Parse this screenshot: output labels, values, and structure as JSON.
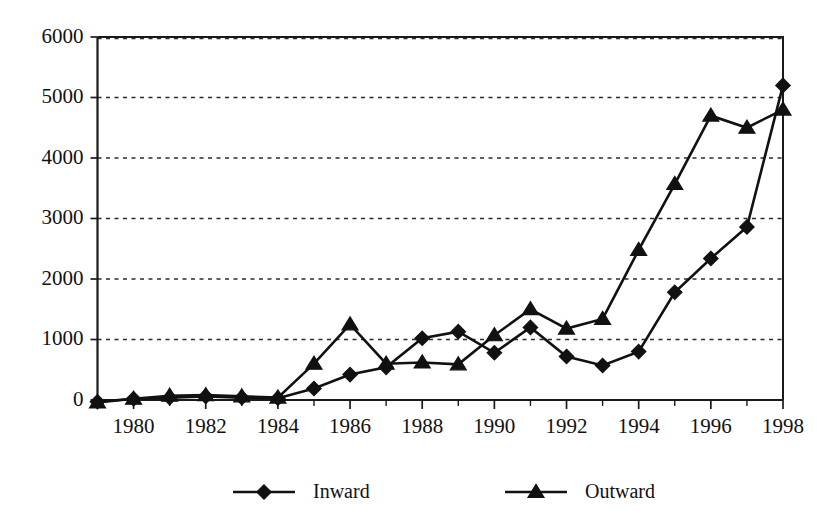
{
  "chart_data": {
    "type": "line",
    "title": "",
    "subtitle": "",
    "xlabel": "",
    "ylabel": "",
    "xlim": [
      1979,
      1998
    ],
    "ylim": [
      0,
      6000
    ],
    "grid": true,
    "legend_position": "bottom",
    "x": [
      1979,
      1980,
      1981,
      1982,
      1983,
      1984,
      1985,
      1986,
      1987,
      1988,
      1989,
      1990,
      1991,
      1992,
      1993,
      1994,
      1995,
      1996,
      1997,
      1998
    ],
    "x_tick_labels": [
      "1980",
      "1982",
      "1984",
      "1986",
      "1988",
      "1990",
      "1992",
      "1994",
      "1996",
      "1998"
    ],
    "x_tick_values": [
      1980,
      1982,
      1984,
      1986,
      1988,
      1990,
      1992,
      1994,
      1996,
      1998
    ],
    "y_tick_labels": [
      "0",
      "1000",
      "2000",
      "3000",
      "4000",
      "5000",
      "6000"
    ],
    "y_tick_values": [
      0,
      1000,
      2000,
      3000,
      4000,
      5000,
      6000
    ],
    "series": [
      {
        "name": "Inward",
        "marker": "diamond",
        "values": [
          -30,
          20,
          40,
          60,
          40,
          30,
          190,
          420,
          540,
          1020,
          1130,
          780,
          1200,
          720,
          570,
          800,
          1780,
          2340,
          2860,
          5200
        ]
      },
      {
        "name": "Outward",
        "marker": "triangle",
        "values": [
          -40,
          20,
          70,
          80,
          60,
          40,
          600,
          1250,
          600,
          620,
          590,
          1070,
          1500,
          1180,
          1340,
          2480,
          3570,
          4700,
          4500,
          4800
        ]
      }
    ]
  },
  "legend": {
    "items": [
      {
        "label": "Inward",
        "marker": "diamond"
      },
      {
        "label": "Outward",
        "marker": "triangle"
      }
    ]
  },
  "colors": {
    "line": "#111111",
    "grid": "#2b2b2b",
    "axis": "#1a1a1a",
    "background": "#ffffff"
  }
}
